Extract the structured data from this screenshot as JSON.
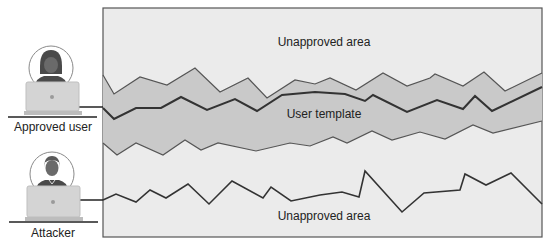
{
  "colors": {
    "frame_fill": "#ebebeb",
    "frame_stroke": "#555555",
    "band_fill": "#c9c9c9",
    "band_stroke": "#555555",
    "template_line": "#333333",
    "attacker_line": "#333333",
    "laptop_fill": "#d4d4d4",
    "laptop_stroke": "#bfbfbf",
    "person_fill": "#5a5a5a",
    "circle_stroke": "#8a8a8a"
  },
  "actors": [
    {
      "id": "approved-user",
      "label": "Approved user"
    },
    {
      "id": "attacker",
      "label": "Attacker"
    }
  ],
  "regions": {
    "top_label": "Unapproved area",
    "band_label": "User template",
    "bottom_label": "Unapproved area"
  },
  "paths": {
    "band_upper": [
      [
        103,
        75
      ],
      [
        114,
        94
      ],
      [
        140,
        77
      ],
      [
        167,
        85
      ],
      [
        195,
        68
      ],
      [
        220,
        92
      ],
      [
        248,
        78
      ],
      [
        267,
        98
      ],
      [
        295,
        80
      ],
      [
        315,
        84
      ],
      [
        330,
        78
      ],
      [
        356,
        90
      ],
      [
        383,
        73
      ],
      [
        407,
        86
      ],
      [
        430,
        78
      ],
      [
        435,
        74
      ],
      [
        463,
        86
      ],
      [
        484,
        72
      ],
      [
        505,
        91
      ],
      [
        542,
        73
      ]
    ],
    "band_lower": [
      [
        103,
        143
      ],
      [
        117,
        155
      ],
      [
        136,
        143
      ],
      [
        163,
        155
      ],
      [
        185,
        140
      ],
      [
        201,
        150
      ],
      [
        218,
        143
      ],
      [
        256,
        151
      ],
      [
        290,
        143
      ],
      [
        310,
        146
      ],
      [
        333,
        137
      ],
      [
        347,
        143
      ],
      [
        372,
        131
      ],
      [
        392,
        140
      ],
      [
        420,
        132
      ],
      [
        445,
        139
      ],
      [
        473,
        125
      ],
      [
        493,
        133
      ],
      [
        542,
        121
      ]
    ],
    "user_template": [
      [
        103,
        108
      ],
      [
        114,
        119
      ],
      [
        136,
        108
      ],
      [
        161,
        108
      ],
      [
        181,
        97
      ],
      [
        207,
        110
      ],
      [
        235,
        99
      ],
      [
        257,
        111
      ],
      [
        282,
        95
      ],
      [
        315,
        92
      ],
      [
        345,
        94
      ],
      [
        365,
        101
      ],
      [
        373,
        95
      ],
      [
        407,
        112
      ],
      [
        437,
        100
      ],
      [
        463,
        109
      ],
      [
        475,
        96
      ],
      [
        492,
        111
      ],
      [
        542,
        87
      ]
    ],
    "attacker_trace": [
      [
        103,
        200
      ],
      [
        116,
        194
      ],
      [
        136,
        202
      ],
      [
        150,
        190
      ],
      [
        166,
        198
      ],
      [
        188,
        184
      ],
      [
        209,
        204
      ],
      [
        232,
        181
      ],
      [
        263,
        198
      ],
      [
        271,
        187
      ],
      [
        291,
        201
      ],
      [
        320,
        195
      ],
      [
        342,
        192
      ],
      [
        359,
        197
      ],
      [
        365,
        171
      ],
      [
        402,
        212
      ],
      [
        424,
        193
      ],
      [
        460,
        190
      ],
      [
        465,
        174
      ],
      [
        486,
        185
      ],
      [
        511,
        173
      ],
      [
        542,
        204
      ]
    ]
  }
}
